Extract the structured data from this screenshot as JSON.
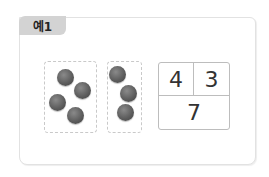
{
  "example_label": "예1",
  "groups": [
    {
      "name": "left-group",
      "count": 4
    },
    {
      "name": "right-group",
      "count": 3
    }
  ],
  "number_table": {
    "top_left": "4",
    "top_right": "3",
    "bottom": "7"
  },
  "colors": {
    "tab_bg": "#d3d3d3",
    "frame_border": "#e2e2e2",
    "dot": "#5e5e5e",
    "table_border": "#bdbdbd"
  }
}
